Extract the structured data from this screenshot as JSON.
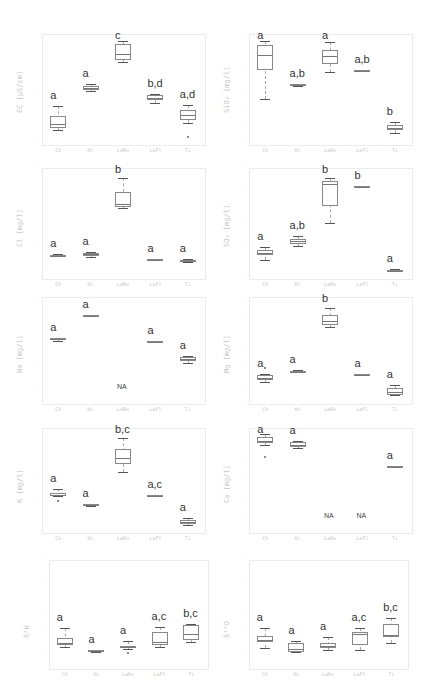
{
  "chart_data": [
    {
      "type": "box",
      "id": "ec",
      "ylabel": "EC [µS/cm]",
      "categories": [
        "Ch",
        "Hi",
        "LaRo",
        "LaFl",
        "Ti"
      ],
      "yticks": [
        "",
        "",
        "",
        "",
        "",
        "",
        ""
      ],
      "boxes": [
        {
          "q1": 0.1,
          "median": 0.14,
          "q3": 0.22,
          "min": 0.08,
          "max": 0.32,
          "letter": "a"
        },
        {
          "q1": 0.49,
          "median": 0.51,
          "q3": 0.53,
          "min": 0.48,
          "max": 0.55,
          "letter": "a"
        },
        {
          "q1": 0.8,
          "median": 0.86,
          "q3": 0.96,
          "min": 0.78,
          "max": 1.0,
          "letter": "c"
        },
        {
          "q1": 0.39,
          "median": 0.41,
          "q3": 0.44,
          "min": 0.36,
          "max": 0.45,
          "letter": "b,d"
        },
        {
          "q1": 0.18,
          "median": 0.23,
          "q3": 0.28,
          "min": 0.15,
          "max": 0.33,
          "letter": "a,d",
          "outliers": [
            0.0
          ]
        }
      ]
    },
    {
      "type": "box",
      "id": "sio2",
      "ylabel": "SiO₂ [mg/l]",
      "categories": [
        "Ch",
        "Hi",
        "LaRo",
        "LaFl",
        "Ti"
      ],
      "boxes": [
        {
          "q1": 0.7,
          "median": 0.85,
          "q3": 0.95,
          "min": 0.4,
          "max": 1.0,
          "letter": "a"
        },
        {
          "q1": 0.53,
          "median": 0.54,
          "q3": 0.55,
          "min": 0.53,
          "max": 0.55,
          "letter": "a,b"
        },
        {
          "q1": 0.76,
          "median": 0.84,
          "q3": 0.9,
          "min": 0.68,
          "max": 0.99,
          "letter": "a"
        },
        {
          "q1": 0.7,
          "median": 0.7,
          "q3": 0.7,
          "min": 0.7,
          "max": 0.7,
          "letter": "a,b"
        },
        {
          "q1": 0.08,
          "median": 0.1,
          "q3": 0.13,
          "min": 0.05,
          "max": 0.16,
          "letter": "b"
        }
      ]
    },
    {
      "type": "box",
      "id": "cl",
      "ylabel": "Cl [mg/l]",
      "categories": [
        "Ch",
        "Hi",
        "LaRo",
        "LaFl",
        "Ti"
      ],
      "boxes": [
        {
          "q1": 0.16,
          "median": 0.165,
          "q3": 0.17,
          "min": 0.155,
          "max": 0.175,
          "letter": "a"
        },
        {
          "q1": 0.16,
          "median": 0.175,
          "q3": 0.185,
          "min": 0.15,
          "max": 0.2,
          "letter": "a"
        },
        {
          "q1": 0.67,
          "median": 0.7,
          "q3": 0.82,
          "min": 0.66,
          "max": 0.96,
          "letter": "b"
        },
        {
          "q1": 0.13,
          "median": 0.13,
          "q3": 0.13,
          "min": 0.13,
          "max": 0.13,
          "letter": "a"
        },
        {
          "q1": 0.1,
          "median": 0.11,
          "q3": 0.12,
          "min": 0.095,
          "max": 0.125,
          "letter": "a"
        }
      ]
    },
    {
      "type": "box",
      "id": "so4",
      "ylabel": "SO₄ [mg/l]",
      "categories": [
        "Ch",
        "Hi",
        "LaRo",
        "LaFl",
        "Ti"
      ],
      "boxes": [
        {
          "q1": 0.17,
          "median": 0.19,
          "q3": 0.22,
          "min": 0.12,
          "max": 0.25,
          "letter": "a"
        },
        {
          "q1": 0.28,
          "median": 0.31,
          "q3": 0.33,
          "min": 0.26,
          "max": 0.37,
          "letter": "a,b"
        },
        {
          "q1": 0.68,
          "median": 0.9,
          "q3": 0.93,
          "min": 0.5,
          "max": 0.97,
          "letter": "b"
        },
        {
          "q1": 0.88,
          "median": 0.88,
          "q3": 0.88,
          "min": 0.88,
          "max": 0.88,
          "letter": "b"
        },
        {
          "q1": 0.005,
          "median": 0.01,
          "q3": 0.015,
          "min": 0.0,
          "max": 0.02,
          "letter": "a"
        }
      ]
    },
    {
      "type": "box",
      "id": "na",
      "ylabel": "Na [mg/l]",
      "categories": [
        "Ch",
        "Hi",
        "LaRo",
        "LaFl",
        "Ti"
      ],
      "boxes": [
        {
          "q1": 0.61,
          "median": 0.62,
          "q3": 0.63,
          "min": 0.6,
          "max": 0.63,
          "letter": "a"
        },
        {
          "q1": 0.86,
          "median": 0.86,
          "q3": 0.87,
          "min": 0.86,
          "max": 0.87,
          "letter": "a"
        },
        null,
        {
          "q1": 0.6,
          "median": 0.6,
          "q3": 0.6,
          "min": 0.6,
          "max": 0.6,
          "letter": "a"
        },
        {
          "q1": 0.38,
          "median": 0.4,
          "q3": 0.42,
          "min": 0.36,
          "max": 0.44,
          "letter": "a"
        }
      ],
      "annotations": [
        {
          "category": "LaRo",
          "text": "NA"
        }
      ]
    },
    {
      "type": "box",
      "id": "mg",
      "ylabel": "Mg [mg/l]",
      "categories": [
        "Ch",
        "Hi",
        "LaRo",
        "LaFl",
        "Ti"
      ],
      "boxes": [
        {
          "q1": 0.18,
          "median": 0.2,
          "q3": 0.23,
          "min": 0.16,
          "max": 0.24,
          "letter": "a",
          "outliers": [
            0.31
          ]
        },
        {
          "q1": 0.26,
          "median": 0.27,
          "q3": 0.28,
          "min": 0.26,
          "max": 0.29,
          "letter": "a"
        },
        {
          "q1": 0.77,
          "median": 0.81,
          "q3": 0.87,
          "min": 0.75,
          "max": 0.95,
          "letter": "b"
        },
        {
          "q1": 0.24,
          "median": 0.24,
          "q3": 0.24,
          "min": 0.24,
          "max": 0.24,
          "letter": "a"
        },
        {
          "q1": 0.02,
          "median": 0.05,
          "q3": 0.09,
          "min": 0.02,
          "max": 0.13,
          "letter": "a"
        }
      ]
    },
    {
      "type": "box",
      "id": "k",
      "ylabel": "K [mg/l]",
      "categories": [
        "Ch",
        "Hi",
        "LaRo",
        "LaFl",
        "Ti"
      ],
      "boxes": [
        {
          "q1": 0.33,
          "median": 0.34,
          "q3": 0.36,
          "min": 0.32,
          "max": 0.4,
          "letter": "a",
          "outliers": [
            0.27
          ]
        },
        {
          "q1": 0.22,
          "median": 0.23,
          "q3": 0.24,
          "min": 0.22,
          "max": 0.24,
          "letter": "a"
        },
        {
          "q1": 0.67,
          "median": 0.74,
          "q3": 0.84,
          "min": 0.59,
          "max": 0.96,
          "letter": "b,c"
        },
        {
          "q1": 0.34,
          "median": 0.34,
          "q3": 0.34,
          "min": 0.34,
          "max": 0.34,
          "letter": "a,c"
        },
        {
          "q1": 0.02,
          "median": 0.04,
          "q3": 0.06,
          "min": 0.01,
          "max": 0.09,
          "letter": "a"
        }
      ]
    },
    {
      "type": "box",
      "id": "ca",
      "ylabel": "Ca [mg/l]",
      "categories": [
        "Ch",
        "Hi",
        "LaRo",
        "LaFl",
        "Ti"
      ],
      "boxes": [
        {
          "q1": 0.9,
          "median": 0.93,
          "q3": 0.97,
          "min": 0.88,
          "max": 1.0,
          "letter": "a",
          "outliers": [
            0.75
          ]
        },
        {
          "q1": 0.86,
          "median": 0.88,
          "q3": 0.91,
          "min": 0.85,
          "max": 0.93,
          "letter": "a"
        },
        null,
        null,
        {
          "q1": 0.64,
          "median": 0.645,
          "q3": 0.65,
          "min": 0.64,
          "max": 0.65,
          "letter": "a"
        }
      ],
      "annotations": [
        {
          "category": "LaRo",
          "text": "NA"
        },
        {
          "category": "LaFl",
          "text": "NA"
        }
      ]
    },
    {
      "type": "box",
      "id": "d2h",
      "ylabel": "δ²H",
      "categories": [
        "Ch",
        "Hi",
        "LaRo",
        "LaFl",
        "Ti"
      ],
      "boxes": [
        {
          "q1": 0.17,
          "median": 0.2,
          "q3": 0.25,
          "min": 0.15,
          "max": 0.35,
          "letter": "a"
        },
        {
          "q1": 0.1,
          "median": 0.11,
          "q3": 0.12,
          "min": 0.1,
          "max": 0.12,
          "letter": "a"
        },
        {
          "q1": 0.14,
          "median": 0.15,
          "q3": 0.16,
          "min": 0.13,
          "max": 0.22,
          "letter": "a",
          "outliers": [
            0.09
          ]
        },
        {
          "q1": 0.17,
          "median": 0.21,
          "q3": 0.31,
          "min": 0.15,
          "max": 0.36,
          "letter": "a,c"
        },
        {
          "q1": 0.23,
          "median": 0.29,
          "q3": 0.38,
          "min": 0.21,
          "max": 0.39,
          "letter": "b,c"
        }
      ]
    },
    {
      "type": "box",
      "id": "d18o",
      "ylabel": "δ¹⁸O",
      "categories": [
        "Ch",
        "Hi",
        "LaRo",
        "LaFl",
        "Ti"
      ],
      "boxes": [
        {
          "q1": 0.21,
          "median": 0.23,
          "q3": 0.27,
          "min": 0.14,
          "max": 0.35,
          "letter": "a"
        },
        {
          "q1": 0.1,
          "median": 0.13,
          "q3": 0.19,
          "min": 0.1,
          "max": 0.22,
          "letter": "a"
        },
        {
          "q1": 0.14,
          "median": 0.16,
          "q3": 0.2,
          "min": 0.12,
          "max": 0.26,
          "letter": "a"
        },
        {
          "q1": 0.17,
          "median": 0.29,
          "q3": 0.31,
          "min": 0.12,
          "max": 0.35,
          "letter": "a,c"
        },
        {
          "q1": 0.26,
          "median": 0.28,
          "q3": 0.4,
          "min": 0.2,
          "max": 0.46,
          "letter": "b,c"
        }
      ]
    }
  ],
  "labels": {
    "ec": "EC [µS/cm]",
    "sio2": "SiO₂ [mg/l]",
    "cl": "Cl [mg/l]",
    "so4": "SO₄ [mg/l]",
    "na": "Na [mg/l]",
    "mg": "Mg [mg/l]",
    "k": "K [mg/l]",
    "ca": "Ca [mg/l]",
    "d2h": "δ²H",
    "d18o": "δ¹⁸O"
  },
  "categories": [
    "Ch",
    "Hi",
    "LaRo",
    "LaFl",
    "Ti"
  ]
}
